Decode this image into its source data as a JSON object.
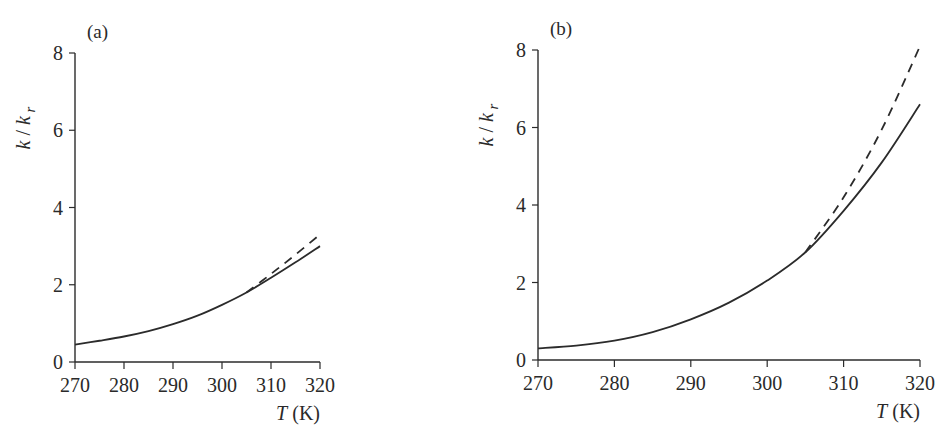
{
  "chart_data": [
    {
      "type": "line",
      "panel_label": "(a)",
      "title": "",
      "xlabel": "T (K)",
      "xlabel_var": "T",
      "xlabel_unit": "(K)",
      "ylabel": "k / k_r",
      "ylabel_parts": {
        "k": "k",
        "slash": " / ",
        "kr": "k",
        "sub": "r"
      },
      "x_ticks": [
        270,
        280,
        290,
        300,
        310,
        320
      ],
      "y_ticks": [
        0,
        2,
        4,
        6,
        8
      ],
      "xlim": [
        270,
        320
      ],
      "ylim": [
        0,
        8
      ],
      "grid": false,
      "legend": "none",
      "series": [
        {
          "name": "solid",
          "style": "solid",
          "x": [
            270,
            275,
            280,
            285,
            290,
            295,
            300,
            305,
            310,
            315,
            320
          ],
          "y": [
            0.45,
            0.55,
            0.66,
            0.8,
            0.98,
            1.2,
            1.48,
            1.8,
            2.18,
            2.58,
            3.0
          ]
        },
        {
          "name": "dashed",
          "style": "dashed",
          "x": [
            305,
            310,
            315,
            320
          ],
          "y": [
            1.8,
            2.28,
            2.78,
            3.3
          ]
        }
      ]
    },
    {
      "type": "line",
      "panel_label": "(b)",
      "title": "",
      "xlabel": "T (K)",
      "xlabel_var": "T",
      "xlabel_unit": "(K)",
      "ylabel": "k / k_r",
      "ylabel_parts": {
        "k": "k",
        "slash": " / ",
        "kr": "k",
        "sub": "r"
      },
      "x_ticks": [
        270,
        280,
        290,
        300,
        310,
        320
      ],
      "y_ticks": [
        0,
        2,
        4,
        6,
        8
      ],
      "xlim": [
        270,
        320
      ],
      "ylim": [
        0,
        8
      ],
      "grid": false,
      "legend": "none",
      "series": [
        {
          "name": "solid",
          "style": "solid",
          "x": [
            270,
            275,
            280,
            285,
            290,
            295,
            300,
            305,
            310,
            315,
            320
          ],
          "y": [
            0.3,
            0.37,
            0.5,
            0.72,
            1.05,
            1.48,
            2.05,
            2.78,
            3.85,
            5.1,
            6.6
          ]
        },
        {
          "name": "dashed",
          "style": "dashed",
          "x": [
            305,
            310,
            315,
            320
          ],
          "y": [
            2.78,
            4.2,
            5.95,
            8.1
          ]
        }
      ]
    }
  ]
}
